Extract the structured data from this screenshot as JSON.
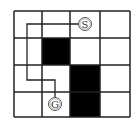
{
  "diagram": {
    "type": "grid-maze",
    "rows": 4,
    "cols": 4,
    "grid": {
      "x0": 14,
      "y0": 11,
      "col_lines": [
        14,
        42,
        70,
        100,
        130
      ],
      "row_lines": [
        11,
        38,
        65,
        92,
        117
      ]
    },
    "colors": {
      "line": "#222222",
      "wall": "#000000",
      "background": "#ffffff"
    },
    "blocked_cells": [
      {
        "row": 1,
        "col": 1
      },
      {
        "row": 2,
        "col": 2
      },
      {
        "row": 3,
        "col": 2
      }
    ],
    "start": {
      "label": "S",
      "row": 0,
      "col": 2,
      "cx": 85,
      "cy": 24
    },
    "goal": {
      "label": "G",
      "row": 3,
      "col": 1,
      "cx": 55,
      "cy": 104
    },
    "path_points": "78,24 27,24 27,80 55,80 55,97"
  }
}
